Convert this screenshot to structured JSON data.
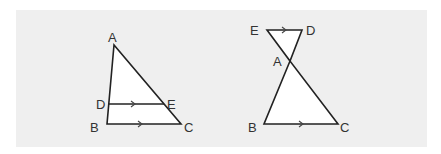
{
  "colors": {
    "background": "#ffffff",
    "panel": "#efefef",
    "stroke": "#222222",
    "fill": "#ffffff",
    "label": "#333333"
  },
  "figures": [
    {
      "name": "triangle-with-parallel-segment",
      "description": "Triangle ABC with segment DE parallel to BC",
      "labels": {
        "A": "A",
        "B": "B",
        "C": "C",
        "D": "D",
        "E": "E"
      },
      "parallel_marks": [
        "DE",
        "BC"
      ]
    },
    {
      "name": "bowtie-triangles",
      "description": "Triangles AED and ABC meeting at vertex A, with ED parallel to BC",
      "labels": {
        "A": "A",
        "B": "B",
        "C": "C",
        "D": "D",
        "E": "E"
      },
      "parallel_marks": [
        "ED",
        "BC"
      ]
    }
  ]
}
